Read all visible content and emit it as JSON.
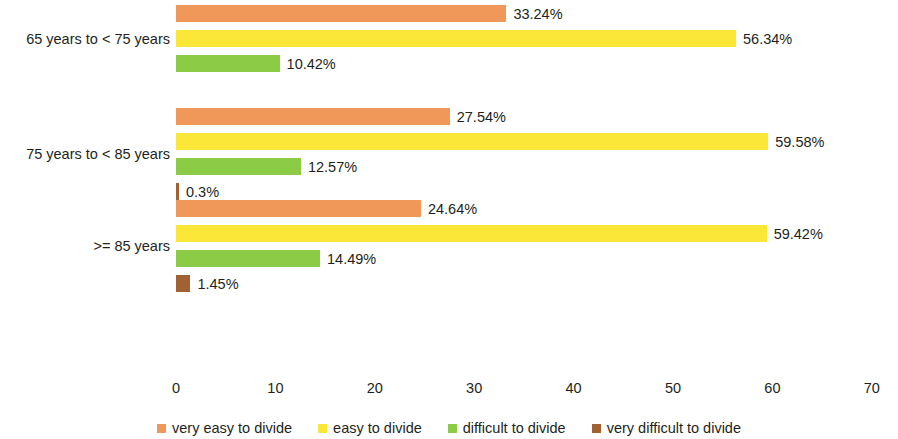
{
  "chart_data": {
    "type": "bar",
    "orientation": "horizontal",
    "title": "",
    "subtitle": "",
    "xlabel": "",
    "ylabel": "",
    "xlim": [
      0,
      70
    ],
    "xticks": [
      "0",
      "10",
      "20",
      "30",
      "40",
      "50",
      "60",
      "70"
    ],
    "grid": false,
    "legend_position": "bottom",
    "categories": [
      "65 years to < 75 years",
      "75 years to < 85 years",
      ">= 85 years"
    ],
    "series": [
      {
        "name": "very easy to divide",
        "color": "#F0975A",
        "values": [
          33.24,
          27.54,
          24.64
        ],
        "labels": [
          "33.24%",
          "27.54%",
          "24.64%"
        ]
      },
      {
        "name": "easy to divide",
        "color": "#FAE738",
        "values": [
          56.34,
          59.58,
          59.42
        ],
        "labels": [
          "56.34%",
          "59.58%",
          "59.42%"
        ]
      },
      {
        "name": "difficult to divide",
        "color": "#8CCB45",
        "values": [
          10.42,
          12.57,
          14.49
        ],
        "labels": [
          "10.42%",
          "12.57%",
          "14.49%"
        ]
      },
      {
        "name": "very difficult to divide",
        "color": "#A06232",
        "values": [
          null,
          0.3,
          1.45
        ],
        "labels": [
          "",
          "0.3%",
          "1.45%"
        ]
      }
    ]
  },
  "axis": {
    "ticks": [
      {
        "label": "0",
        "value": 0
      },
      {
        "label": "10",
        "value": 10
      },
      {
        "label": "20",
        "value": 20
      },
      {
        "label": "30",
        "value": 30
      },
      {
        "label": "40",
        "value": 40
      },
      {
        "label": "50",
        "value": 50
      },
      {
        "label": "60",
        "value": 60
      },
      {
        "label": "70",
        "value": 70
      }
    ]
  },
  "legend": {
    "items": [
      {
        "label": "very easy to divide",
        "color": "#F0975A"
      },
      {
        "label": "easy to divide",
        "color": "#FAE738"
      },
      {
        "label": "difficult to divide",
        "color": "#8CCB45"
      },
      {
        "label": "very difficult to divide",
        "color": "#A06232"
      }
    ]
  }
}
